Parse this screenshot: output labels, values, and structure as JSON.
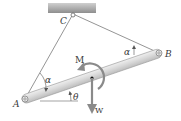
{
  "diagram": {
    "type": "statics-free-body",
    "labels": {
      "support_pin": "C",
      "left_pin": "A",
      "right_pin": "B",
      "moment": "M",
      "weight": "W",
      "angle_at_A": "α",
      "angle_at_B": "α",
      "bar_angle": "θ"
    },
    "colors": {
      "ceiling_top": "#c9c9c9",
      "ceiling_bottom": "#8f8f8f",
      "cable": "#7a7a7a",
      "bar_fill": "#dcdcdc",
      "bar_edge": "#9a9a9a",
      "arrow": "#8a8a8a",
      "text": "#3a3a3a",
      "center_dot": "#111111"
    },
    "points": {
      "C": [
        73,
        14
      ],
      "A": [
        25,
        99
      ],
      "B": [
        159,
        53
      ],
      "center": [
        92,
        78
      ]
    }
  }
}
